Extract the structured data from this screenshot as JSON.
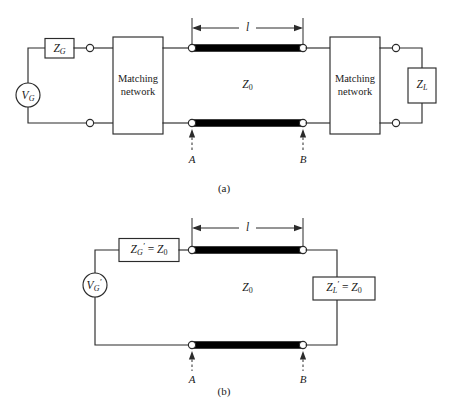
{
  "figure": {
    "background_color": "#ffffff",
    "line_color": "#2b2b2b",
    "transmission_line_color": "#000000"
  },
  "panel_a": {
    "caption": "(a)",
    "source_label": "V",
    "source_sub": "G",
    "generator_impedance_label": "Z",
    "generator_impedance_sub": "G",
    "matching_network_left_line1": "Matching",
    "matching_network_left_line2": "network",
    "matching_network_right_line1": "Matching",
    "matching_network_right_line2": "network",
    "characteristic_impedance_label": "Z",
    "characteristic_impedance_sub": "0",
    "load_impedance_label": "Z",
    "load_impedance_sub": "L",
    "length_label": "l",
    "reference_plane_a": "A",
    "reference_plane_b": "B"
  },
  "panel_b": {
    "caption": "(b)",
    "source_label": "V",
    "source_sub": "G",
    "source_prime": "′",
    "generator_impedance_expr_lhs": "Z",
    "generator_impedance_sub": "G",
    "generator_impedance_prime": "′",
    "generator_impedance_eq": "=",
    "generator_impedance_rhs": "Z",
    "generator_impedance_rhs_sub": "0",
    "characteristic_impedance_label": "Z",
    "characteristic_impedance_sub": "0",
    "load_impedance_expr_lhs": "Z",
    "load_impedance_sub": "L",
    "load_impedance_prime": "′",
    "load_impedance_eq": "=",
    "load_impedance_rhs": "Z",
    "load_impedance_rhs_sub": "0",
    "length_label": "l",
    "reference_plane_a": "A",
    "reference_plane_b": "B"
  }
}
